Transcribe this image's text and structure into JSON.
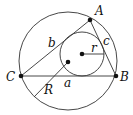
{
  "diagram": {
    "vertices": [
      {
        "label": "A",
        "x": 90,
        "y": 20
      },
      {
        "label": "B",
        "x": 116,
        "y": 76
      },
      {
        "label": "C",
        "x": 21,
        "y": 76
      }
    ],
    "sides": [
      {
        "label": "a",
        "between": "B-C"
      },
      {
        "label": "b",
        "between": "C-A"
      },
      {
        "label": "c",
        "between": "A-B"
      }
    ],
    "circumcircle": {
      "cx": 68,
      "cy": 61,
      "r": 49,
      "radius_label": "R"
    },
    "incircle": {
      "cx": 82,
      "cy": 54,
      "r": 22,
      "radius_label": "r"
    },
    "labels": {
      "A": "A",
      "B": "B",
      "C": "C",
      "a": "a",
      "b": "b",
      "c": "c",
      "r": "r",
      "R": "R"
    },
    "colors": {
      "stroke": "#222222",
      "background": "#ffffff"
    }
  }
}
